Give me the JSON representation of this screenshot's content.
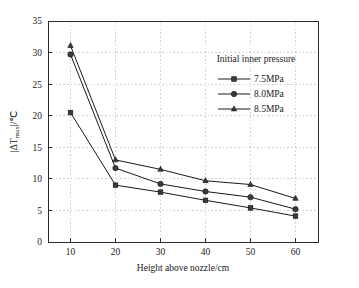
{
  "chart_data": {
    "type": "line",
    "title": "",
    "xlabel": "Height above nozzle/cm",
    "ylabel": "|ΔTₘₐₓ|/℃",
    "ylabel_parts": {
      "prefix": "|ΔT",
      "subscript": "max",
      "suffix": "|/℃"
    },
    "x": [
      10,
      20,
      30,
      40,
      50,
      60
    ],
    "xticks": [
      "10",
      "20",
      "30",
      "40",
      "50",
      "60"
    ],
    "yticks": [
      "0",
      "5",
      "10",
      "15",
      "20",
      "25",
      "30",
      "35"
    ],
    "xlim": [
      5,
      65
    ],
    "ylim": [
      0,
      35
    ],
    "grid": true,
    "grid_style": "dotted",
    "legend_position": "upper-right-inside",
    "legend_title": "Initial inner pressure",
    "series": [
      {
        "name": "7.5MPa",
        "marker": "square",
        "values": [
          20.5,
          9.0,
          7.9,
          6.6,
          5.4,
          4.1
        ]
      },
      {
        "name": "8.0MPa",
        "marker": "circle",
        "values": [
          29.7,
          11.7,
          9.2,
          8.0,
          7.1,
          5.2
        ]
      },
      {
        "name": "8.5MPa",
        "marker": "triangle",
        "values": [
          31.1,
          13.0,
          11.5,
          9.7,
          9.1,
          6.9
        ]
      }
    ],
    "colors": {
      "axis": "#2b2b2b",
      "grid": "#bdbdbd",
      "line": "#1a1a1a",
      "marker_fill": "#3a3a3a",
      "background": "#ffffff"
    }
  }
}
